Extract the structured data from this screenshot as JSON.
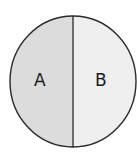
{
  "diagram": {
    "shape": "circle",
    "regions": [
      {
        "label": "A",
        "fill": "#dcdcdc"
      },
      {
        "label": "B",
        "fill": "#efefef"
      }
    ],
    "outline_color": "#2a2a2a",
    "divider_color": "#2a2a2a"
  }
}
